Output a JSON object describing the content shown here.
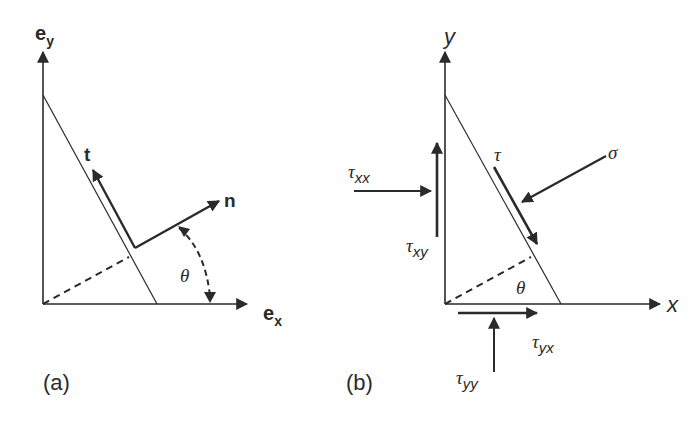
{
  "colors": {
    "ink": "#2a2a2a",
    "background": "#ffffff"
  },
  "panel_a": {
    "caption": "(a)",
    "y_axis": {
      "base": "e",
      "sub": "y"
    },
    "x_axis": {
      "base": "e",
      "sub": "x"
    },
    "tangent_label": "t",
    "normal_label": "n",
    "angle_label": "θ"
  },
  "panel_b": {
    "caption": "(b)",
    "y_axis_label": "y",
    "x_axis_label": "x",
    "angle_label": "θ",
    "shear_on_face_label": "τ",
    "normal_stress_label": "σ",
    "tau_xx": {
      "base": "τ",
      "sub": "xx"
    },
    "tau_xy": {
      "base": "τ",
      "sub": "xy"
    },
    "tau_yx": {
      "base": "τ",
      "sub": "yx"
    },
    "tau_yy": {
      "base": "τ",
      "sub": "yy"
    }
  }
}
